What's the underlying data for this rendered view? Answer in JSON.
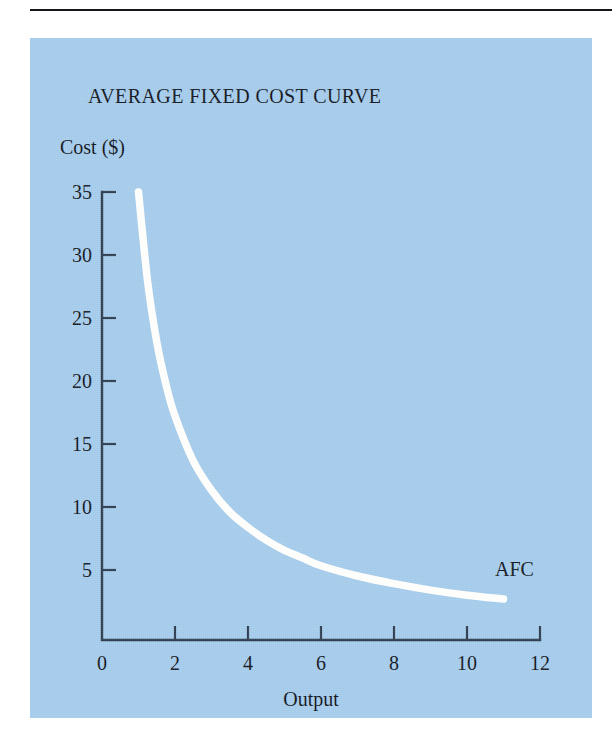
{
  "figure": {
    "panel_bg_color": "#a3caea",
    "rule_color": "#15161a",
    "axis_color": "#2b3a4c",
    "curve_color": "#fdfdfb"
  },
  "chart_data": {
    "type": "line",
    "title": "AVERAGE FIXED COST CURVE",
    "xlabel": "Output",
    "ylabel": "Cost ($)",
    "xlim": [
      0,
      12
    ],
    "ylim": [
      0,
      35
    ],
    "grid": false,
    "legend": "none",
    "x_ticks": [
      "0",
      "2",
      "4",
      "6",
      "8",
      "10",
      "12"
    ],
    "x_tick_values": [
      0,
      2,
      4,
      6,
      8,
      10,
      12
    ],
    "y_ticks": [
      "5",
      "10",
      "15",
      "20",
      "25",
      "30",
      "35"
    ],
    "y_tick_values": [
      5,
      10,
      15,
      20,
      25,
      30,
      35
    ],
    "annotations": [
      {
        "text": "AFC",
        "x": 11.3,
        "y": 5.0
      }
    ],
    "series": [
      {
        "name": "AFC",
        "label": "AFC",
        "relation": "AFC = TFC / Q, TFC = 35",
        "color": "#fdfdfb",
        "x": [
          1.0,
          1.25,
          1.5,
          1.75,
          2.0,
          2.5,
          3.0,
          3.5,
          4.0,
          4.5,
          5.0,
          5.5,
          6.0,
          7.0,
          8.0,
          9.0,
          10.0,
          11.0
        ],
        "values": [
          35.0,
          28.0,
          23.3,
          20.0,
          17.5,
          14.0,
          11.7,
          10.0,
          8.8,
          7.8,
          7.0,
          6.4,
          5.8,
          5.0,
          4.4,
          3.9,
          3.5,
          3.2
        ]
      }
    ]
  }
}
